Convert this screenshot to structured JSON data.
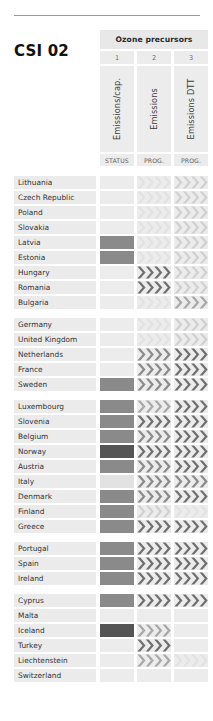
{
  "page": {
    "code": "CSI 02",
    "group_title": "Ozone precursors"
  },
  "columns": [
    {
      "number": "1",
      "vertical_label": "Emissions/cap.",
      "sub_label": "STATUS"
    },
    {
      "number": "2",
      "vertical_label": "Emissions",
      "sub_label": "PROG."
    },
    {
      "number": "3",
      "vertical_label": "Emissions DTT",
      "sub_label": "PROG."
    }
  ],
  "palette": {
    "page_background": "#ffffff",
    "rule": "#9a9a9a",
    "header_fill": "#e8e8e8",
    "cell_fill": "#ececec",
    "name_fill": "#ebebeb",
    "title_text": "#111111",
    "label_text": "#333333",
    "tone_blank": "#ececec",
    "tone_lightest": "#e2e2e2",
    "tone_light": "#d0d0d0",
    "tone_mid": "#a8a8a8",
    "tone_dark": "#8a8a8a",
    "tone_darker": "#6f6f6f",
    "tone_darkest": "#555555"
  },
  "legend_tones": {
    "blank": "none / no data",
    "light": "light grey",
    "mid": "medium grey",
    "dark": "dark grey",
    "darkest": "darkest grey"
  },
  "groups": [
    {
      "rows": [
        {
          "country": "Lithuania",
          "status": "blank",
          "prog2": "lightest",
          "prog3": "light"
        },
        {
          "country": "Czech Republic",
          "status": "blank",
          "prog2": "lightest",
          "prog3": "light"
        },
        {
          "country": "Poland",
          "status": "blank",
          "prog2": "lightest",
          "prog3": "light"
        },
        {
          "country": "Slovakia",
          "status": "blank",
          "prog2": "lightest",
          "prog3": "light"
        },
        {
          "country": "Latvia",
          "status": "dark",
          "prog2": "lightest",
          "prog3": "light"
        },
        {
          "country": "Estonia",
          "status": "dark",
          "prog2": "lightest",
          "prog3": "light"
        },
        {
          "country": "Hungary",
          "status": "blank",
          "prog2": "darker",
          "prog3": "light"
        },
        {
          "country": "Romania",
          "status": "blank",
          "prog2": "darker",
          "prog3": "light"
        },
        {
          "country": "Bulgaria",
          "status": "blank",
          "prog2": "lightest",
          "prog3": "mid"
        }
      ]
    },
    {
      "rows": [
        {
          "country": "Germany",
          "status": "blank",
          "prog2": "lightest",
          "prog3": "light"
        },
        {
          "country": "United Kingdom",
          "status": "blank",
          "prog2": "lightest",
          "prog3": "light"
        },
        {
          "country": "Netherlands",
          "status": "blank",
          "prog2": "dark",
          "prog3": "darker"
        },
        {
          "country": "France",
          "status": "blank",
          "prog2": "dark",
          "prog3": "darker"
        },
        {
          "country": "Sweden",
          "status": "dark",
          "prog2": "dark",
          "prog3": "darker"
        }
      ]
    },
    {
      "rows": [
        {
          "country": "Luxembourg",
          "status": "dark",
          "prog2": "mid",
          "prog3": "darker"
        },
        {
          "country": "Slovenia",
          "status": "dark",
          "prog2": "darker",
          "prog3": "darker"
        },
        {
          "country": "Belgium",
          "status": "dark",
          "prog2": "dark",
          "prog3": "darker"
        },
        {
          "country": "Norway",
          "status": "darkest",
          "prog2": "darker",
          "prog3": "darker"
        },
        {
          "country": "Austria",
          "status": "dark",
          "prog2": "dark",
          "prog3": "darker"
        },
        {
          "country": "Italy",
          "status": "lightest",
          "prog2": "dark",
          "prog3": "dark"
        },
        {
          "country": "Denmark",
          "status": "dark",
          "prog2": "dark",
          "prog3": "darker"
        },
        {
          "country": "Finland",
          "status": "dark",
          "prog2": "light",
          "prog3": "lightest"
        },
        {
          "country": "Greece",
          "status": "dark",
          "prog2": "darker",
          "prog3": "darker"
        }
      ]
    },
    {
      "rows": [
        {
          "country": "Portugal",
          "status": "dark",
          "prog2": "darker",
          "prog3": "darker"
        },
        {
          "country": "Spain",
          "status": "dark",
          "prog2": "darker",
          "prog3": "darker"
        },
        {
          "country": "Ireland",
          "status": "dark",
          "prog2": "darker",
          "prog3": "darker"
        }
      ]
    },
    {
      "rows": [
        {
          "country": "Cyprus",
          "status": "dark",
          "prog2": "darker",
          "prog3": "darker"
        },
        {
          "country": "Malta",
          "status": "blank",
          "prog2": "blank",
          "prog3": "blank"
        },
        {
          "country": "Iceland",
          "status": "darkest",
          "prog2": "mid",
          "prog3": "blank"
        },
        {
          "country": "Turkey",
          "status": "blank",
          "prog2": "darker",
          "prog3": "blank"
        },
        {
          "country": "Liechtenstein",
          "status": "blank",
          "prog2": "mid",
          "prog3": "lightest"
        },
        {
          "country": "Switzerland",
          "status": "blank",
          "prog2": "blank",
          "prog3": "blank"
        }
      ]
    }
  ]
}
